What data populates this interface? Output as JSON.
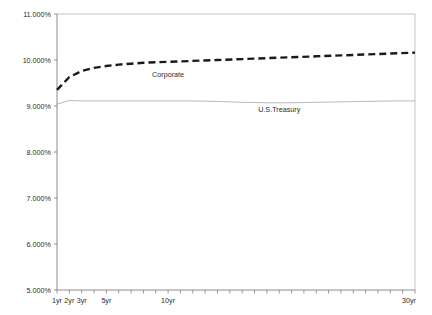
{
  "chart_data": {
    "type": "line",
    "title": "",
    "xlabel": "",
    "ylabel": "",
    "ylim": [
      5.0,
      11.0
    ],
    "ytick_step": 1.0,
    "ytick_labels": [
      "11.000%",
      "10.000%",
      "9.000%",
      "8.000%",
      "7.000%",
      "6.000%",
      "5.000%"
    ],
    "ytick_values": [
      11.0,
      10.0,
      9.0,
      8.0,
      7.0,
      6.0,
      5.0
    ],
    "xtick_labels": [
      "1yr",
      "2yr",
      "3yr",
      "5yr",
      "10yr",
      "30yr"
    ],
    "xtick_values": [
      1,
      2,
      3,
      5,
      10,
      30
    ],
    "x_minor_tick_count": 30,
    "grid": false,
    "legend_position": "inline-annotation",
    "x": [
      1,
      2,
      3,
      4,
      5,
      6,
      7,
      8,
      9,
      10,
      12,
      14,
      16,
      18,
      20,
      22,
      24,
      26,
      28,
      30
    ],
    "series": [
      {
        "name": "Corporate",
        "style": "dashed",
        "color": "#1a1a1a",
        "width": 2.4,
        "label_x": 10,
        "label_y": 9.63,
        "values": [
          9.35,
          9.63,
          9.76,
          9.83,
          9.87,
          9.9,
          9.92,
          9.94,
          9.95,
          9.96,
          9.98,
          10.0,
          10.02,
          10.04,
          10.06,
          10.08,
          10.1,
          10.12,
          10.14,
          10.16
        ]
      },
      {
        "name": "U.S.Treasury",
        "style": "solid",
        "color": "#9a9a9a",
        "width": 0.7,
        "label_x": 19,
        "label_y": 8.87,
        "values": [
          9.04,
          9.12,
          9.11,
          9.11,
          9.11,
          9.11,
          9.11,
          9.11,
          9.11,
          9.11,
          9.11,
          9.1,
          9.08,
          9.07,
          9.07,
          9.08,
          9.09,
          9.1,
          9.11,
          9.11
        ]
      }
    ]
  },
  "plot": {
    "frame_color": "#b4b4b4",
    "axis_color": "#7a7a7a",
    "background": "#ffffff"
  }
}
